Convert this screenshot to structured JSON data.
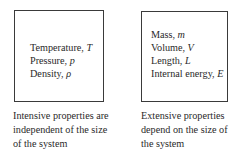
{
  "intensive": {
    "properties": [
      {
        "name": "Temperature, ",
        "symbol": "T"
      },
      {
        "name": "Pressure, ",
        "symbol": "p"
      },
      {
        "name": "Density, ",
        "symbol": "ρ"
      }
    ],
    "caption": [
      "Intensive properties are",
      "independent of the size",
      "of the system"
    ]
  },
  "extensive": {
    "properties": [
      {
        "name": "Mass, ",
        "symbol": "m"
      },
      {
        "name": "Volume, ",
        "symbol": "V"
      },
      {
        "name": "Length, ",
        "symbol": "L"
      },
      {
        "name": "Internal energy, ",
        "symbol": "E"
      }
    ],
    "caption": [
      "Extensive properties",
      "depend on the size of",
      "the system"
    ]
  }
}
